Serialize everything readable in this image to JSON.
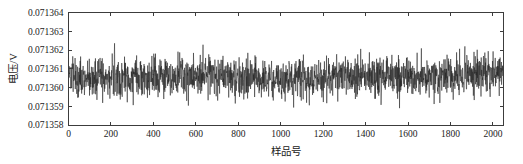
{
  "chart_data": {
    "type": "line",
    "title": "",
    "subtitle": "",
    "xlabel": "样品号",
    "ylabel": "电压/V",
    "xlim": [
      0,
      2050
    ],
    "ylim": [
      0.071358,
      0.071364
    ],
    "xticks": [
      0,
      200,
      400,
      600,
      800,
      1000,
      1200,
      1400,
      1600,
      1800,
      2000
    ],
    "xticklabels": [
      "0",
      "200",
      "400",
      "600",
      "800",
      "1000",
      "1200",
      "1400",
      "1600",
      "1800",
      "2000"
    ],
    "yticks": [
      0.071358,
      0.071359,
      0.07136,
      0.071361,
      0.071362,
      0.071363,
      0.071364
    ],
    "yticklabels": [
      "0.071358",
      "0.071359",
      "0.071360",
      "0.071361",
      "0.071362",
      "0.071363",
      "0.071364"
    ],
    "grid": false,
    "legend": false,
    "legend_position": "none",
    "n_points": 2050,
    "series": [
      {
        "name": "电压",
        "color": "#242424",
        "linewidth": 0.55,
        "mean": 0.0713606,
        "std": 5.5e-07,
        "min": 0.0713582,
        "max": 0.0713631,
        "description": "dense voltage noise record, stationary about 0.0713606 V"
      }
    ],
    "noise_seed": 20250114,
    "noise_spike_seed": 8831
  },
  "axes": {
    "x_axis_name": "sample-number-axis",
    "y_axis_name": "voltage-axis",
    "tick_direction": "in",
    "frame": "box",
    "frame_color": "#3c3c3c",
    "background": "#ffffff"
  }
}
